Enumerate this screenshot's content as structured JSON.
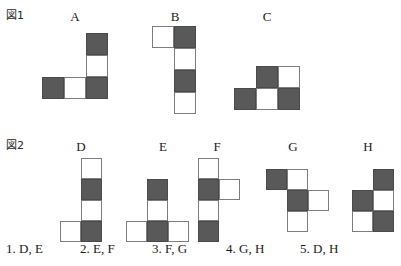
{
  "figures": [
    {
      "label": "図1",
      "label_x": 6,
      "label_y": 6,
      "shapes": [
        {
          "name": "A",
          "title_x": 42,
          "title_y": 10,
          "grid_x": 42,
          "grid_y": 33,
          "cols": 3,
          "rows": 3,
          "cell": 22,
          "cells": [
            {
              "r": 0,
              "c": 2,
              "fill": "dark"
            },
            {
              "r": 1,
              "c": 2,
              "fill": "light"
            },
            {
              "r": 2,
              "c": 0,
              "fill": "dark"
            },
            {
              "r": 2,
              "c": 1,
              "fill": "light"
            },
            {
              "r": 2,
              "c": 2,
              "fill": "dark"
            }
          ]
        },
        {
          "name": "B",
          "title_x": 145,
          "title_y": 10,
          "grid_x": 145,
          "grid_y": 26,
          "cols": 2,
          "rows": 4,
          "cell": 22,
          "cells": [
            {
              "r": 0,
              "c": 0,
              "fill": "light"
            },
            {
              "r": 0,
              "c": 1,
              "fill": "dark"
            },
            {
              "r": 1,
              "c": 1,
              "fill": "light"
            },
            {
              "r": 2,
              "c": 1,
              "fill": "dark"
            },
            {
              "r": 3,
              "c": 1,
              "fill": "light"
            }
          ]
        },
        {
          "name": "C",
          "title_x": 238,
          "title_y": 10,
          "grid_x": 228,
          "grid_y": 66,
          "cols": 3,
          "rows": 2,
          "cell": 22,
          "cells": [
            {
              "r": 0,
              "c": 1,
              "fill": "dark"
            },
            {
              "r": 0,
              "c": 2,
              "fill": "light"
            },
            {
              "r": 1,
              "c": 0,
              "fill": "dark"
            },
            {
              "r": 1,
              "c": 1,
              "fill": "light"
            },
            {
              "r": 1,
              "c": 2,
              "fill": "dark"
            }
          ]
        }
      ]
    },
    {
      "label": "図2",
      "label_x": 6,
      "label_y": 136,
      "shapes": [
        {
          "name": "D",
          "title_x": 60,
          "title_y": 140,
          "grid_x": 50,
          "grid_y": 158,
          "cols": 2,
          "rows": 4,
          "cell": 21,
          "cells": [
            {
              "r": 0,
              "c": 1,
              "fill": "light"
            },
            {
              "r": 1,
              "c": 1,
              "fill": "dark"
            },
            {
              "r": 2,
              "c": 1,
              "fill": "light"
            },
            {
              "r": 3,
              "c": 0,
              "fill": "light"
            },
            {
              "r": 3,
              "c": 1,
              "fill": "dark"
            }
          ]
        },
        {
          "name": "E",
          "title_x": 132,
          "title_y": 140,
          "grid_x": 122,
          "grid_y": 179,
          "cols": 3,
          "rows": 3,
          "cell": 21,
          "cells": [
            {
              "r": 0,
              "c": 1,
              "fill": "dark"
            },
            {
              "r": 1,
              "c": 1,
              "fill": "light"
            },
            {
              "r": 2,
              "c": 0,
              "fill": "light"
            },
            {
              "r": 2,
              "c": 1,
              "fill": "dark"
            },
            {
              "r": 2,
              "c": 2,
              "fill": "light"
            }
          ]
        },
        {
          "name": "F",
          "title_x": 205,
          "title_y": 140,
          "grid_x": 205,
          "grid_y": 158,
          "cols": 2,
          "rows": 4,
          "cell": 21,
          "cells": [
            {
              "r": 0,
              "c": 0,
              "fill": "light"
            },
            {
              "r": 1,
              "c": 0,
              "fill": "dark"
            },
            {
              "r": 1,
              "c": 1,
              "fill": "light"
            },
            {
              "r": 2,
              "c": 0,
              "fill": "light"
            },
            {
              "r": 3,
              "c": 0,
              "fill": "dark"
            }
          ]
        },
        {
          "name": "G",
          "title_x": 279,
          "title_y": 140,
          "grid_x": 269,
          "grid_y": 169,
          "cols": 3,
          "rows": 3,
          "cell": 21,
          "cells": [
            {
              "r": 0,
              "c": 0,
              "fill": "dark"
            },
            {
              "r": 0,
              "c": 1,
              "fill": "light"
            },
            {
              "r": 1,
              "c": 1,
              "fill": "dark"
            },
            {
              "r": 1,
              "c": 2,
              "fill": "light"
            },
            {
              "r": 2,
              "c": 1,
              "fill": "light"
            }
          ]
        },
        {
          "name": "H",
          "title_x": 355,
          "title_y": 140,
          "grid_x": 350,
          "grid_y": 169,
          "cols": 2,
          "rows": 3,
          "cell": 21,
          "cells": [
            {
              "r": 0,
              "c": 1,
              "fill": "dark"
            },
            {
              "r": 1,
              "c": 0,
              "fill": "dark"
            },
            {
              "r": 1,
              "c": 1,
              "fill": "light"
            },
            {
              "r": 2,
              "c": 0,
              "fill": "light"
            },
            {
              "r": 2,
              "c": 1,
              "fill": "dark"
            }
          ]
        }
      ]
    }
  ],
  "answers": [
    {
      "id": "1",
      "text": "1. D, E"
    },
    {
      "id": "2",
      "text": "2. E, F"
    },
    {
      "id": "3",
      "text": "3. F, G"
    },
    {
      "id": "4",
      "text": "4. G, H"
    },
    {
      "id": "5",
      "text": "5. D, H"
    }
  ],
  "colors": {
    "dark_cell": "#595959",
    "light_cell": "#ffffff",
    "cell_border": "#7d7d7d",
    "text": "#1a1a1a",
    "background": "#ffffff"
  }
}
